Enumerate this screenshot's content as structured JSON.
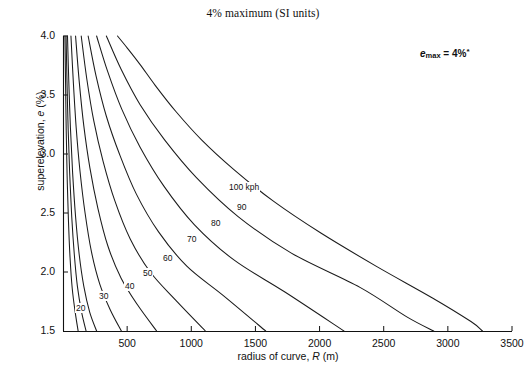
{
  "chart_data": {
    "type": "line",
    "title": "4% maximum (SI units)",
    "xlabel": "radius of curve, R (m)",
    "xlabel_prefix": "radius of curve, ",
    "xlabel_italic": "R",
    "xlabel_suffix": " (m)",
    "ylabel": "superelevation, e (%)",
    "ylabel_prefix": "superelevation, ",
    "ylabel_italic": "e",
    "ylabel_suffix": " (%)",
    "xlim": [
      0,
      3500
    ],
    "ylim": [
      1.5,
      4.0
    ],
    "xticks": [
      0,
      500,
      1000,
      1500,
      2000,
      2500,
      3000,
      3500
    ],
    "xtick_labels": [
      "",
      "500",
      "1000",
      "1500",
      "2000",
      "2500",
      "3000",
      "3500"
    ],
    "yticks": [
      1.5,
      2.0,
      2.5,
      3.0,
      3.5,
      4.0
    ],
    "ytick_labels": [
      "1.5",
      "2.0",
      "2.5",
      "3.0",
      "3.5",
      "4.0"
    ],
    "grid": false,
    "legend": "inline-curve-labels",
    "annotation": {
      "text": "emax = 4%*",
      "symbol": "e",
      "subscript": "max",
      "equals": "=",
      "value": "4%",
      "footnote_marker": "*"
    },
    "series": [
      {
        "name": "20",
        "label": "20",
        "label_x": 75,
        "label_y": 303,
        "points": [
          [
            15,
            4.0
          ],
          [
            20,
            3.6
          ],
          [
            25,
            3.2
          ],
          [
            32,
            2.82
          ],
          [
            42,
            2.45
          ],
          [
            55,
            2.12
          ],
          [
            72,
            1.86
          ],
          [
            95,
            1.66
          ],
          [
            118,
            1.5
          ]
        ]
      },
      {
        "name": "25",
        "label": "",
        "label_x": 0,
        "label_y": 0,
        "points": [
          [
            24,
            4.0
          ],
          [
            31,
            3.62
          ],
          [
            40,
            3.22
          ],
          [
            52,
            2.84
          ],
          [
            68,
            2.47
          ],
          [
            88,
            2.15
          ],
          [
            112,
            1.88
          ],
          [
            145,
            1.66
          ],
          [
            180,
            1.5
          ]
        ]
      },
      {
        "name": "30",
        "label": "30",
        "label_x": 98,
        "label_y": 291,
        "points": [
          [
            35,
            4.0
          ],
          [
            45,
            3.62
          ],
          [
            58,
            3.22
          ],
          [
            75,
            2.84
          ],
          [
            98,
            2.47
          ],
          [
            126,
            2.15
          ],
          [
            162,
            1.88
          ],
          [
            208,
            1.66
          ],
          [
            262,
            1.5
          ]
        ]
      },
      {
        "name": "40",
        "label": "40",
        "label_x": 124,
        "label_y": 281,
        "points": [
          [
            62,
            4.0
          ],
          [
            80,
            3.62
          ],
          [
            103,
            3.22
          ],
          [
            133,
            2.85
          ],
          [
            172,
            2.5
          ],
          [
            222,
            2.17
          ],
          [
            286,
            1.9
          ],
          [
            368,
            1.68
          ],
          [
            455,
            1.5
          ]
        ]
      },
      {
        "name": "50",
        "label": "50",
        "label_x": 142,
        "label_y": 268,
        "points": [
          [
            98,
            4.0
          ],
          [
            126,
            3.62
          ],
          [
            162,
            3.24
          ],
          [
            210,
            2.88
          ],
          [
            272,
            2.54
          ],
          [
            350,
            2.22
          ],
          [
            452,
            1.95
          ],
          [
            582,
            1.72
          ],
          [
            730,
            1.5
          ]
        ]
      },
      {
        "name": "60",
        "label": "60",
        "label_x": 162,
        "label_y": 253,
        "points": [
          [
            142,
            4.0
          ],
          [
            185,
            3.64
          ],
          [
            240,
            3.28
          ],
          [
            312,
            2.94
          ],
          [
            405,
            2.6
          ],
          [
            524,
            2.28
          ],
          [
            680,
            2.0
          ],
          [
            880,
            1.76
          ],
          [
            1110,
            1.5
          ]
        ]
      },
      {
        "name": "70",
        "label": "70",
        "label_x": 186,
        "label_y": 234,
        "points": [
          [
            196,
            4.0
          ],
          [
            258,
            3.66
          ],
          [
            338,
            3.32
          ],
          [
            440,
            3.0
          ],
          [
            572,
            2.66
          ],
          [
            745,
            2.34
          ],
          [
            965,
            2.05
          ],
          [
            1250,
            1.8
          ],
          [
            1580,
            1.5
          ]
        ]
      },
      {
        "name": "80",
        "label": "80",
        "label_x": 210,
        "label_y": 218,
        "points": [
          [
            262,
            4.0
          ],
          [
            348,
            3.7
          ],
          [
            458,
            3.38
          ],
          [
            600,
            3.06
          ],
          [
            785,
            2.73
          ],
          [
            1025,
            2.4
          ],
          [
            1335,
            2.1
          ],
          [
            1730,
            1.83
          ],
          [
            2190,
            1.5
          ]
        ]
      },
      {
        "name": "90",
        "label": "90",
        "label_x": 236,
        "label_y": 202,
        "points": [
          [
            338,
            4.0
          ],
          [
            452,
            3.72
          ],
          [
            600,
            3.42
          ],
          [
            792,
            3.12
          ],
          [
            1040,
            2.8
          ],
          [
            1365,
            2.47
          ],
          [
            1780,
            2.16
          ],
          [
            2315,
            1.87
          ],
          [
            2680,
            1.62
          ],
          [
            2890,
            1.5
          ]
        ]
      },
      {
        "name": "100 kph",
        "label": "100 kph",
        "label_x": 228,
        "label_y": 182,
        "points": [
          [
            425,
            4.0
          ],
          [
            500,
            3.9
          ],
          [
            600,
            3.76
          ],
          [
            720,
            3.58
          ],
          [
            880,
            3.36
          ],
          [
            1080,
            3.12
          ],
          [
            1330,
            2.87
          ],
          [
            1640,
            2.6
          ],
          [
            2010,
            2.33
          ],
          [
            2440,
            2.05
          ],
          [
            2880,
            1.78
          ],
          [
            3180,
            1.58
          ],
          [
            3270,
            1.5
          ]
        ]
      }
    ]
  },
  "plot_geometry": {
    "origin_x": 63,
    "origin_y": 331,
    "right_x": 512,
    "top_y": 36,
    "x_per_unit": 0.12657,
    "y_per_unit": 118
  }
}
